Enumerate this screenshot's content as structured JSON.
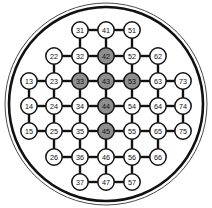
{
  "figure": {
    "name": "wafer-node-grid",
    "width": 212,
    "height": 208,
    "background_color": "#ffffff"
  },
  "boundary": {
    "name": "wafer-outline",
    "shape": "circle",
    "center_x": 106,
    "center_y": 104,
    "outer_radius": 101,
    "inner_radius": 97,
    "outer_stroke_color": "#4a4a4a",
    "inner_stroke_color": "#111111"
  },
  "legend": {
    "filled_label": "",
    "empty_label": ""
  },
  "colors": {
    "node_filled": "#8e8e8e",
    "node_empty": "#ffffff",
    "node_stroke": "#111111",
    "edge": "#111111",
    "label": "#111111"
  },
  "grid": {
    "columns": 7,
    "rows": 7,
    "column_x": [
      29,
      54,
      80,
      106,
      132,
      158,
      183
    ],
    "row_y": [
      30,
      56,
      81,
      106,
      131,
      157,
      182
    ],
    "node_radius": 8.2
  },
  "chart_data": {
    "type": "scatter",
    "title": "",
    "xlabel": "",
    "ylabel": "",
    "nodes": [
      {
        "id": "31",
        "label": "31",
        "col": 3,
        "row": 1,
        "state": "empty"
      },
      {
        "id": "41",
        "label": "41",
        "col": 4,
        "row": 1,
        "state": "empty"
      },
      {
        "id": "51",
        "label": "51",
        "col": 5,
        "row": 1,
        "state": "empty"
      },
      {
        "id": "22",
        "label": "22",
        "col": 2,
        "row": 2,
        "state": "empty"
      },
      {
        "id": "32",
        "label": "32",
        "col": 3,
        "row": 2,
        "state": "empty"
      },
      {
        "id": "42",
        "label": "42",
        "col": 4,
        "row": 2,
        "state": "filled"
      },
      {
        "id": "52",
        "label": "52",
        "col": 5,
        "row": 2,
        "state": "empty"
      },
      {
        "id": "62",
        "label": "62",
        "col": 6,
        "row": 2,
        "state": "empty"
      },
      {
        "id": "13",
        "label": "13",
        "col": 1,
        "row": 3,
        "state": "empty"
      },
      {
        "id": "23",
        "label": "23",
        "col": 2,
        "row": 3,
        "state": "empty"
      },
      {
        "id": "33",
        "label": "33",
        "col": 3,
        "row": 3,
        "state": "filled"
      },
      {
        "id": "43",
        "label": "43",
        "col": 4,
        "row": 3,
        "state": "filled"
      },
      {
        "id": "53",
        "label": "53",
        "col": 5,
        "row": 3,
        "state": "filled"
      },
      {
        "id": "63",
        "label": "63",
        "col": 6,
        "row": 3,
        "state": "empty"
      },
      {
        "id": "73",
        "label": "73",
        "col": 7,
        "row": 3,
        "state": "empty"
      },
      {
        "id": "14",
        "label": "14",
        "col": 1,
        "row": 4,
        "state": "empty"
      },
      {
        "id": "24",
        "label": "24",
        "col": 2,
        "row": 4,
        "state": "empty"
      },
      {
        "id": "34",
        "label": "34",
        "col": 3,
        "row": 4,
        "state": "empty"
      },
      {
        "id": "44",
        "label": "44",
        "col": 4,
        "row": 4,
        "state": "filled"
      },
      {
        "id": "54",
        "label": "54",
        "col": 5,
        "row": 4,
        "state": "empty"
      },
      {
        "id": "64",
        "label": "64",
        "col": 6,
        "row": 4,
        "state": "empty"
      },
      {
        "id": "74",
        "label": "74",
        "col": 7,
        "row": 4,
        "state": "empty"
      },
      {
        "id": "15",
        "label": "15",
        "col": 1,
        "row": 5,
        "state": "empty"
      },
      {
        "id": "25",
        "label": "25",
        "col": 2,
        "row": 5,
        "state": "empty"
      },
      {
        "id": "35",
        "label": "35",
        "col": 3,
        "row": 5,
        "state": "empty"
      },
      {
        "id": "45",
        "label": "45",
        "col": 4,
        "row": 5,
        "state": "filled"
      },
      {
        "id": "55",
        "label": "55",
        "col": 5,
        "row": 5,
        "state": "empty"
      },
      {
        "id": "65",
        "label": "65",
        "col": 6,
        "row": 5,
        "state": "empty"
      },
      {
        "id": "75",
        "label": "75",
        "col": 7,
        "row": 5,
        "state": "empty"
      },
      {
        "id": "26",
        "label": "26",
        "col": 2,
        "row": 6,
        "state": "empty"
      },
      {
        "id": "36",
        "label": "36",
        "col": 3,
        "row": 6,
        "state": "empty"
      },
      {
        "id": "46",
        "label": "46",
        "col": 4,
        "row": 6,
        "state": "empty"
      },
      {
        "id": "56",
        "label": "56",
        "col": 5,
        "row": 6,
        "state": "empty"
      },
      {
        "id": "66",
        "label": "66",
        "col": 6,
        "row": 6,
        "state": "empty"
      },
      {
        "id": "37",
        "label": "37",
        "col": 3,
        "row": 7,
        "state": "empty"
      },
      {
        "id": "47",
        "label": "47",
        "col": 4,
        "row": 7,
        "state": "empty"
      },
      {
        "id": "57",
        "label": "57",
        "col": 5,
        "row": 7,
        "state": "empty"
      }
    ],
    "edges": [
      [
        "31",
        "41"
      ],
      [
        "41",
        "51"
      ],
      [
        "22",
        "32"
      ],
      [
        "32",
        "42"
      ],
      [
        "42",
        "52"
      ],
      [
        "52",
        "62"
      ],
      [
        "13",
        "23"
      ],
      [
        "23",
        "33"
      ],
      [
        "33",
        "43"
      ],
      [
        "43",
        "53"
      ],
      [
        "53",
        "63"
      ],
      [
        "63",
        "73"
      ],
      [
        "14",
        "24"
      ],
      [
        "24",
        "34"
      ],
      [
        "34",
        "44"
      ],
      [
        "44",
        "54"
      ],
      [
        "54",
        "64"
      ],
      [
        "64",
        "74"
      ],
      [
        "15",
        "25"
      ],
      [
        "25",
        "35"
      ],
      [
        "35",
        "45"
      ],
      [
        "45",
        "55"
      ],
      [
        "55",
        "65"
      ],
      [
        "65",
        "75"
      ],
      [
        "26",
        "36"
      ],
      [
        "36",
        "46"
      ],
      [
        "46",
        "56"
      ],
      [
        "56",
        "66"
      ],
      [
        "37",
        "47"
      ],
      [
        "47",
        "57"
      ],
      [
        "31",
        "32"
      ],
      [
        "32",
        "33"
      ],
      [
        "33",
        "34"
      ],
      [
        "34",
        "35"
      ],
      [
        "35",
        "36"
      ],
      [
        "36",
        "37"
      ],
      [
        "41",
        "42"
      ],
      [
        "42",
        "43"
      ],
      [
        "43",
        "44"
      ],
      [
        "44",
        "45"
      ],
      [
        "45",
        "46"
      ],
      [
        "46",
        "47"
      ],
      [
        "51",
        "52"
      ],
      [
        "52",
        "53"
      ],
      [
        "53",
        "54"
      ],
      [
        "54",
        "55"
      ],
      [
        "55",
        "56"
      ],
      [
        "56",
        "57"
      ],
      [
        "22",
        "23"
      ],
      [
        "23",
        "24"
      ],
      [
        "24",
        "25"
      ],
      [
        "25",
        "26"
      ],
      [
        "62",
        "63"
      ],
      [
        "63",
        "64"
      ],
      [
        "64",
        "65"
      ],
      [
        "65",
        "66"
      ],
      [
        "13",
        "14"
      ],
      [
        "14",
        "15"
      ],
      [
        "73",
        "74"
      ],
      [
        "74",
        "75"
      ]
    ]
  }
}
